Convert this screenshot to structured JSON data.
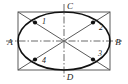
{
  "figure": {
    "canvas": {
      "width": 128,
      "height": 84,
      "background": "#ffffff"
    },
    "colors": {
      "ellipse_stroke": "#111111",
      "rectangle_stroke": "#5a5a5a",
      "diagonal_stroke": "#5a5a5a",
      "axis_stroke": "#6b6b6b",
      "point_fill": "#111111",
      "label_fill": "#1a1a1a"
    },
    "rectangle": {
      "name": "bounding-rectangle",
      "x": 18,
      "y": 12,
      "width": 92,
      "height": 58
    },
    "ellipse": {
      "name": "inscribed-ellipse",
      "cx": 64,
      "cy": 41,
      "rx": 46,
      "ry": 29
    },
    "axes": [
      {
        "name": "horizontal-axis",
        "x1": 6,
        "y1": 41,
        "x2": 122,
        "y2": 41,
        "style": "dash-dot"
      },
      {
        "name": "vertical-axis",
        "x1": 64,
        "y1": 4,
        "x2": 64,
        "y2": 78,
        "style": "dash-dot"
      }
    ],
    "diagonals": [
      {
        "name": "diagonal-tl-br",
        "x1": 18,
        "y1": 12,
        "x2": 110,
        "y2": 70
      },
      {
        "name": "diagonal-tr-bl",
        "x1": 110,
        "y1": 12,
        "x2": 18,
        "y2": 70
      }
    ],
    "vertex_labels": [
      {
        "id": "A",
        "text": "A",
        "x": 10,
        "y": 45,
        "anchor": "middle"
      },
      {
        "id": "B",
        "text": "B",
        "x": 118,
        "y": 45,
        "anchor": "middle"
      },
      {
        "id": "C",
        "text": "C",
        "x": 70,
        "y": 9,
        "anchor": "middle"
      },
      {
        "id": "D",
        "text": "D",
        "x": 70,
        "y": 80,
        "anchor": "middle"
      }
    ],
    "points": [
      {
        "id": "1",
        "text": "1",
        "px": 35.0,
        "py": 22.5,
        "lx": 42,
        "ly": 24
      },
      {
        "id": "2",
        "text": "2",
        "px": 93.0,
        "py": 22.5,
        "lx": 99,
        "ly": 30
      },
      {
        "id": "3",
        "text": "3",
        "px": 93.0,
        "py": 59.5,
        "lx": 98,
        "ly": 56
      },
      {
        "id": "4",
        "text": "4",
        "px": 35.0,
        "py": 59.5,
        "lx": 42,
        "ly": 63
      }
    ]
  }
}
